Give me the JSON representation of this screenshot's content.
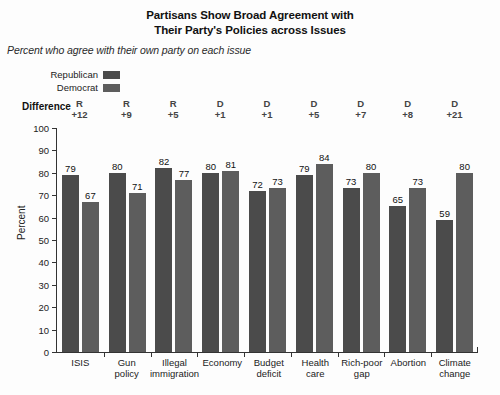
{
  "chart_data": {
    "type": "bar",
    "title": "Partisans Show Broad Agreement with Their Party's Policies across Issues",
    "title_lines": [
      "Partisans Show Broad Agreement with",
      "Their Party's Policies across Issues"
    ],
    "subtitle": "Percent who agree with their own party on each issue",
    "xlabel": "",
    "ylabel": "Percent",
    "ylim": [
      0,
      100
    ],
    "yticks": [
      0,
      10,
      20,
      30,
      40,
      50,
      60,
      70,
      80,
      90,
      100
    ],
    "ytick_labels": [
      "0",
      "10",
      "20",
      "30",
      "40",
      "50",
      "60",
      "70",
      "80",
      "90",
      "100"
    ],
    "grid": false,
    "legend_position": "top-left",
    "categories": [
      "ISIS",
      "Gun policy",
      "Illegal immigration",
      "Economy",
      "Budget deficit",
      "Health care",
      "Rich-poor gap",
      "Abortion",
      "Climate change"
    ],
    "category_lines": [
      [
        "ISIS"
      ],
      [
        "Gun",
        "policy"
      ],
      [
        "Illegal",
        "immigration"
      ],
      [
        "Economy"
      ],
      [
        "Budget",
        "deficit"
      ],
      [
        "Health",
        "care"
      ],
      [
        "Rich-poor",
        "gap"
      ],
      [
        "Abortion"
      ],
      [
        "Climate",
        "change"
      ]
    ],
    "series": [
      {
        "name": "Republican",
        "color": "#4b4b4b",
        "values": [
          79,
          80,
          82,
          80,
          72,
          79,
          73,
          65,
          59
        ]
      },
      {
        "name": "Democrat",
        "color": "#5d5d5d",
        "values": [
          67,
          71,
          77,
          81,
          73,
          84,
          80,
          73,
          80
        ]
      }
    ],
    "annotations": {
      "difference_row_label": "Difference",
      "difference": [
        {
          "party": "R",
          "value": "+12"
        },
        {
          "party": "R",
          "value": "+9"
        },
        {
          "party": "R",
          "value": "+5"
        },
        {
          "party": "D",
          "value": "+1"
        },
        {
          "party": "D",
          "value": "+1"
        },
        {
          "party": "D",
          "value": "+5"
        },
        {
          "party": "D",
          "value": "+7"
        },
        {
          "party": "D",
          "value": "+8"
        },
        {
          "party": "D",
          "value": "+21"
        }
      ]
    }
  },
  "legend": {
    "items": [
      {
        "label": "Republican",
        "color": "#4b4b4b"
      },
      {
        "label": "Democrat",
        "color": "#5d5d5d"
      }
    ]
  },
  "colors": {
    "republican": "#4b4b4b",
    "democrat": "#5d5d5d",
    "axis": "#333333",
    "text": "#1a1a1a",
    "background": "#fdfdfd"
  }
}
